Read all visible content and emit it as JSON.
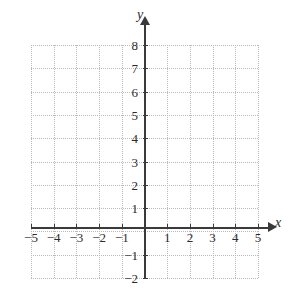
{
  "figure": {
    "title": "",
    "axis_labels": {
      "x": "x",
      "y": "y"
    },
    "background_color": "#ffffff",
    "axis_color": "#3a3a3a",
    "grid_color": "#b9b9b9"
  },
  "chart_data": {
    "type": "scatter",
    "title": "",
    "xlabel": "x",
    "ylabel": "y",
    "xlim": [
      -5,
      5
    ],
    "ylim": [
      -2,
      8
    ],
    "grid": true,
    "grid_style": "dotted",
    "legend": null,
    "series": [],
    "x_ticks": [
      -5,
      -4,
      -3,
      -2,
      -1,
      1,
      2,
      3,
      4,
      5
    ],
    "y_ticks": [
      -2,
      -1,
      1,
      2,
      3,
      4,
      5,
      6,
      7,
      8
    ],
    "x_tick_labels": [
      "−5",
      "−4",
      "−3",
      "−2",
      "−1",
      "1",
      "2",
      "3",
      "4",
      "5"
    ],
    "y_tick_labels": [
      "−2",
      "−1",
      "1",
      "2",
      "3",
      "4",
      "5",
      "6",
      "7",
      "8"
    ],
    "annotations": [],
    "data_points": []
  }
}
